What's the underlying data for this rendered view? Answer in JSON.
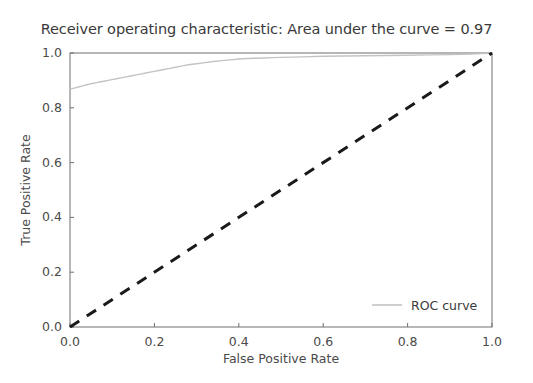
{
  "chart_data": {
    "type": "line",
    "title": "Receiver operating characteristic: Area under the curve = 0.97",
    "xlabel": "False Positive Rate",
    "ylabel": "True Positive Rate",
    "xlim": [
      0.0,
      1.0
    ],
    "ylim": [
      0.0,
      1.0
    ],
    "grid": false,
    "legend_position": "lower right",
    "auc": 0.97,
    "xticks": [
      "0.0",
      "0.2",
      "0.4",
      "0.6",
      "0.8",
      "1.0"
    ],
    "xtick_values": [
      0.0,
      0.2,
      0.4,
      0.6,
      0.8,
      1.0
    ],
    "yticks": [
      "0.0",
      "0.2",
      "0.4",
      "0.6",
      "0.8",
      "1.0"
    ],
    "ytick_values": [
      0.0,
      0.2,
      0.4,
      0.6,
      0.8,
      1.0
    ],
    "series": [
      {
        "name": "ROC curve",
        "color": "#c3c3c3",
        "linestyle": "solid",
        "linewidth": 1.4,
        "x": [
          0.0,
          0.01,
          0.02,
          0.03,
          0.04,
          0.05,
          0.06,
          0.07,
          0.08,
          0.09,
          0.1,
          0.11,
          0.12,
          0.13,
          0.14,
          0.15,
          0.16,
          0.17,
          0.18,
          0.19,
          0.2,
          0.21,
          0.22,
          0.23,
          0.24,
          0.25,
          0.26,
          0.27,
          0.28,
          0.29,
          0.3,
          0.32,
          0.34,
          0.36,
          0.38,
          0.4,
          0.42,
          0.44,
          0.46,
          0.48,
          0.5,
          0.55,
          0.6,
          0.65,
          0.7,
          0.75,
          0.8,
          0.85,
          0.9,
          0.95,
          1.0
        ],
        "y": [
          0.868,
          0.872,
          0.876,
          0.88,
          0.884,
          0.888,
          0.891,
          0.894,
          0.897,
          0.9,
          0.903,
          0.906,
          0.909,
          0.912,
          0.915,
          0.918,
          0.921,
          0.924,
          0.927,
          0.93,
          0.933,
          0.936,
          0.939,
          0.942,
          0.945,
          0.948,
          0.951,
          0.954,
          0.957,
          0.959,
          0.961,
          0.965,
          0.969,
          0.972,
          0.975,
          0.978,
          0.98,
          0.981,
          0.982,
          0.983,
          0.984,
          0.986,
          0.988,
          0.989,
          0.99,
          0.991,
          0.992,
          0.993,
          0.994,
          0.996,
          1.0
        ]
      },
      {
        "name": "chance-diagonal",
        "color": "#1a1a1a",
        "linestyle": "dashed",
        "linewidth": 3,
        "x": [
          0.0,
          1.0
        ],
        "y": [
          0.0,
          1.0
        ]
      }
    ],
    "legend": [
      {
        "label": "ROC curve",
        "color": "#c3c3c3",
        "linestyle": "solid"
      }
    ]
  }
}
